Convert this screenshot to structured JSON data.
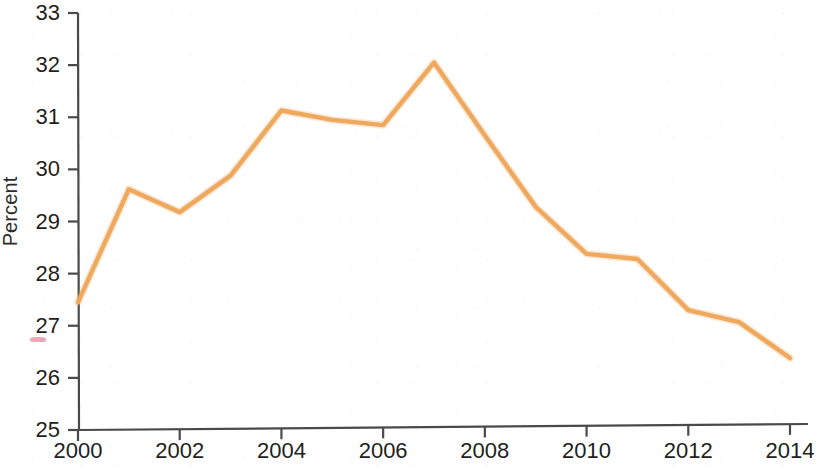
{
  "chart_data": {
    "type": "line",
    "title": "",
    "subtitle": "",
    "xlabel": "",
    "ylabel": "Percent",
    "x": [
      2000,
      2001,
      2002,
      2003,
      2004,
      2005,
      2006,
      2007,
      2008,
      2009,
      2010,
      2011,
      2012,
      2013,
      2014
    ],
    "series": [
      {
        "name": "Percent",
        "color": "#efa95e",
        "values": [
          27.45,
          29.62,
          29.18,
          29.88,
          31.13,
          30.95,
          30.85,
          32.05,
          30.65,
          29.28,
          28.38,
          28.28,
          27.3,
          27.07,
          26.38
        ]
      }
    ],
    "xlim": [
      2000,
      2014
    ],
    "ylim": [
      25,
      33
    ],
    "x_ticks": [
      2000,
      2002,
      2004,
      2006,
      2008,
      2010,
      2012,
      2014
    ],
    "x_tick_labels": [
      "2000",
      "2002",
      "2004",
      "2006",
      "2008",
      "2010",
      "2012",
      "2014"
    ],
    "y_ticks": [
      25,
      26,
      27,
      28,
      29,
      30,
      31,
      32,
      33
    ],
    "y_tick_labels": [
      "25",
      "26",
      "27",
      "28",
      "29",
      "30",
      "31",
      "32",
      "33"
    ],
    "grid": false,
    "legend": false,
    "legend_position": "none"
  },
  "axes": {
    "y_label": "Percent",
    "y_ticks": [
      {
        "value": 33,
        "label": "33"
      },
      {
        "value": 32,
        "label": "32"
      },
      {
        "value": 31,
        "label": "31"
      },
      {
        "value": 30,
        "label": "30"
      },
      {
        "value": 29,
        "label": "29"
      },
      {
        "value": 28,
        "label": "28"
      },
      {
        "value": 27,
        "label": "27"
      },
      {
        "value": 26,
        "label": "26"
      },
      {
        "value": 25,
        "label": "25"
      }
    ],
    "x_ticks": [
      {
        "value": 2000,
        "label": "2000"
      },
      {
        "value": 2002,
        "label": "2002"
      },
      {
        "value": 2004,
        "label": "2004"
      },
      {
        "value": 2006,
        "label": "2006"
      },
      {
        "value": 2008,
        "label": "2008"
      },
      {
        "value": 2010,
        "label": "2010"
      },
      {
        "value": 2012,
        "label": "2012"
      },
      {
        "value": 2014,
        "label": "2014"
      }
    ]
  },
  "style": {
    "line_color": "#efa95e",
    "axis_color": "#4a4a4a",
    "text_color": "#221f20",
    "background": "#ffffff",
    "smudge_color": "#d9607a",
    "smudge_at_tick": "27"
  },
  "geometry": {
    "plot_left": 78,
    "plot_right": 790,
    "plot_top": 13,
    "plot_bottom": 430
  }
}
